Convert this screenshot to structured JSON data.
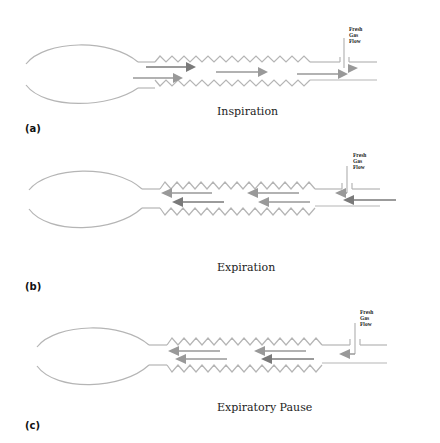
{
  "figure": {
    "colors": {
      "line": "#b5b5b5",
      "arrow_dark": "#7a7a7a",
      "arrow_light": "#999999",
      "text": "#222222"
    },
    "panels": [
      {
        "id": "a",
        "label": "(a)",
        "caption": "Inspiration",
        "fresh_gas_flow_label": [
          "Fresh",
          "Gas",
          "Flow"
        ],
        "flow_direction": "toward-patient-end (left to right)"
      },
      {
        "id": "b",
        "label": "(b)",
        "caption": "Expiration",
        "fresh_gas_flow_label": [
          "Fresh",
          "Gas",
          "Flow"
        ],
        "flow_direction": "right to left"
      },
      {
        "id": "c",
        "label": "(c)",
        "caption": "Expiratory Pause",
        "fresh_gas_flow_label": [
          "Fresh",
          "Gas",
          "Flow"
        ],
        "flow_direction": "right to left"
      }
    ]
  }
}
